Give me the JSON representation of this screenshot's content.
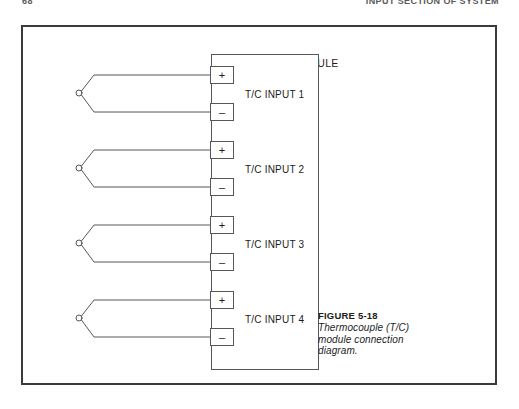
{
  "page": {
    "running_head_left": "68",
    "running_head_right": "INPUT SECTION OF SYSTEM"
  },
  "module": {
    "title": "T/C INPUT MODULE"
  },
  "terminals": {
    "positive": "+",
    "negative": "–"
  },
  "channels": [
    {
      "label": "T/C INPUT 1",
      "plus": "+",
      "minus": "–"
    },
    {
      "label": "T/C INPUT 2",
      "plus": "+",
      "minus": "–"
    },
    {
      "label": "T/C INPUT 3",
      "plus": "+",
      "minus": "–"
    },
    {
      "label": "T/C INPUT 4",
      "plus": "+",
      "minus": "–"
    }
  ],
  "caption": {
    "title": "FIGURE 5-18",
    "line1": "Thermocouple (T/C)",
    "line2": "module connection",
    "line3": "diagram."
  },
  "colors": {
    "frame": "#3b3b3b",
    "line": "#55575a",
    "text": "#1c1c1c",
    "background": "#ffffff"
  }
}
